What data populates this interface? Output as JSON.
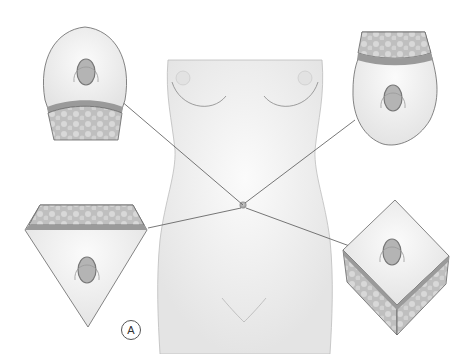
{
  "figure": {
    "panel_label": "A",
    "navel_center": [
      243,
      205
    ],
    "callouts": [
      {
        "id": "oval-top",
        "shape": "U-shaped skin flap, fat layer below",
        "position": "top-left",
        "anchor": [
          120,
          100
        ]
      },
      {
        "id": "oval-bottom",
        "shape": "inverted U-shaped skin flap, fat layer above",
        "position": "top-right",
        "anchor": [
          355,
          120
        ]
      },
      {
        "id": "triangle",
        "shape": "inverted triangle skin flap, fat layer above",
        "position": "bottom-left",
        "anchor": [
          148,
          228
        ]
      },
      {
        "id": "diamond",
        "shape": "cube / diamond skin flap with fat sides",
        "position": "bottom-right",
        "anchor": [
          355,
          248
        ]
      }
    ]
  },
  "colors": {
    "skin": "#efefef",
    "outline": "#7a7a7a",
    "fat": "#bdbdbd",
    "band": "#9a9a9a",
    "line": "#555555"
  }
}
